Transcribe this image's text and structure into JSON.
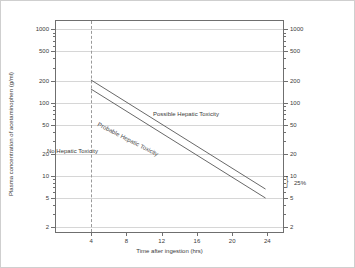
{
  "chart_data": {
    "type": "line",
    "title": "RUMACK MATTHEW NOMOGRAM",
    "xlabel": "Time after ingestion (hrs)",
    "ylabel": "Plasma concentration of acetaminophen (g/ml)",
    "xlim": [
      0,
      26
    ],
    "ylim": [
      1.6,
      1300
    ],
    "yscale": "log",
    "xscale": "linear",
    "grid": true,
    "legend": "none",
    "xticks": [
      4,
      8,
      12,
      16,
      20,
      24
    ],
    "xtick_labels": [
      "4",
      "8",
      "12",
      "16",
      "20",
      "24"
    ],
    "yticks": [
      1000,
      500,
      200,
      100,
      50,
      20,
      10,
      5,
      2
    ],
    "ytick_labels": [
      "1000",
      "500",
      "200",
      "100",
      "50",
      "20",
      "10",
      "5",
      "2"
    ],
    "y_axis_right_labels": [
      "1000",
      "500",
      "200",
      "100",
      "50",
      "20",
      "10",
      "5",
      "2"
    ],
    "series": [
      {
        "name": "Probable hepatic toxicity line (200 line)",
        "x": [
          4,
          24
        ],
        "y": [
          200,
          6.25
        ]
      },
      {
        "name": "Treatment line (150 line, 25% below)",
        "x": [
          4,
          24
        ],
        "y": [
          150,
          4.7
        ]
      }
    ],
    "reference_lines": [
      {
        "name": "4 hour reference",
        "orientation": "vertical",
        "x": 4,
        "style": "dashed"
      }
    ],
    "annotations": [
      {
        "text": "Possible Hepatic Toxicity",
        "x": 15.5,
        "y": 42
      },
      {
        "text": "No Hepatic Toxicity",
        "x": 7.2,
        "y": 14
      },
      {
        "text": "Probable Hepatic Toxicity",
        "x": 11.5,
        "y": 33,
        "rotated": true
      },
      {
        "text": "25%",
        "x": 25.2,
        "y": 5.3
      }
    ]
  },
  "colors": {
    "background": "#ffffff",
    "axis": "#6f6f6f",
    "grid": "#d6d6d6",
    "line": "#555555",
    "text": "#3a3a3a",
    "dashed_reference": "#9a9a9a"
  },
  "brace_glyph": "}"
}
